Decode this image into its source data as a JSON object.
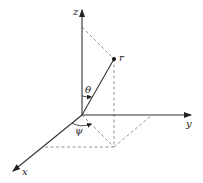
{
  "diagram": {
    "title": "",
    "type": "spherical-coordinates",
    "colors": {
      "axis": "#333333",
      "dashed": "#888888",
      "text": "#222222",
      "point": "#111111"
    },
    "labels": {
      "x_axis": "x",
      "y_axis": "y",
      "z_axis": "z",
      "point": "r",
      "theta": "θ",
      "psi": "ψ"
    },
    "geometry": {
      "origin": [
        82,
        115
      ],
      "z_tip": [
        82,
        9
      ],
      "y_tip": [
        192,
        115
      ],
      "x_tip": [
        12,
        172
      ],
      "point_r": [
        114,
        59
      ],
      "projection_xy": [
        114,
        147
      ],
      "z_projection": [
        82,
        27
      ],
      "y_projection": [
        152,
        115
      ],
      "x_projection": [
        44,
        147
      ]
    }
  }
}
